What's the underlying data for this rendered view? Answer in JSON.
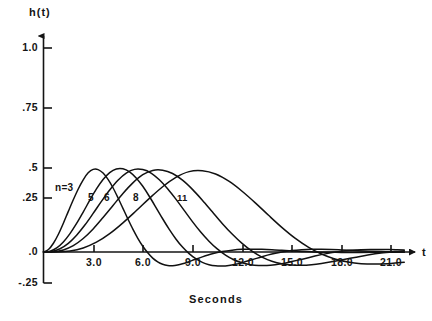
{
  "figure": {
    "axis_titles": {
      "y": "h(t)",
      "x": "t"
    },
    "x_axis_caption": "Seconds",
    "bottom_caption": ""
  },
  "chart_data": {
    "type": "line",
    "title": "",
    "subtitle": "",
    "xlabel": "Seconds",
    "ylabel": "h(t)",
    "xlim": [
      0,
      22.2
    ],
    "ylim": [
      -0.25,
      1.0
    ],
    "grid": false,
    "legend_position": "inline-curve-labels",
    "x_ticks": [
      3.0,
      6.0,
      9.0,
      12.0,
      15.0,
      18.0,
      21.0
    ],
    "x_tick_labels": [
      "3.0",
      "6.0",
      "9.0",
      "12.0",
      "15.0",
      "18.0",
      "21.0"
    ],
    "y_ticks": [
      1.0,
      0.75,
      0.5,
      0.25,
      0.0,
      -0.25
    ],
    "y_tick_labels": [
      "1.0",
      ".75",
      ".5",
      ".25",
      ".0",
      "-.25"
    ],
    "annotations": [
      {
        "text": "n=3",
        "x": 1.05,
        "y": 0.3
      },
      {
        "text": "5",
        "x": 2.75,
        "y": 0.255
      },
      {
        "text": "6",
        "x": 3.65,
        "y": 0.255
      },
      {
        "text": "8",
        "x": 5.35,
        "y": 0.255
      },
      {
        "text": "11",
        "x": 8.05,
        "y": 0.255
      }
    ],
    "series": [
      {
        "name": "n=3",
        "label": "n=3",
        "peak_time": 2.5,
        "peak_value": 0.405,
        "points": [
          [
            0.0,
            0.0
          ],
          [
            0.3,
            0.012
          ],
          [
            0.6,
            0.043
          ],
          [
            0.9,
            0.087
          ],
          [
            1.2,
            0.141
          ],
          [
            1.5,
            0.199
          ],
          [
            1.8,
            0.256
          ],
          [
            2.1,
            0.309
          ],
          [
            2.4,
            0.354
          ],
          [
            2.7,
            0.388
          ],
          [
            3.0,
            0.405
          ],
          [
            3.3,
            0.404
          ],
          [
            3.6,
            0.387
          ],
          [
            3.9,
            0.356
          ],
          [
            4.2,
            0.315
          ],
          [
            4.5,
            0.266
          ],
          [
            4.8,
            0.214
          ],
          [
            5.1,
            0.162
          ],
          [
            5.4,
            0.112
          ],
          [
            5.7,
            0.067
          ],
          [
            6.0,
            0.028
          ],
          [
            6.3,
            -0.004
          ],
          [
            6.6,
            -0.03
          ],
          [
            6.9,
            -0.048
          ],
          [
            7.2,
            -0.06
          ],
          [
            7.5,
            -0.066
          ],
          [
            7.8,
            -0.067
          ],
          [
            8.1,
            -0.064
          ],
          [
            8.4,
            -0.058
          ],
          [
            8.7,
            -0.05
          ],
          [
            9.0,
            -0.041
          ],
          [
            9.6,
            -0.024
          ],
          [
            10.2,
            -0.009
          ],
          [
            10.8,
            0.002
          ],
          [
            11.4,
            0.009
          ],
          [
            12.0,
            0.013
          ],
          [
            12.6,
            0.014
          ],
          [
            13.2,
            0.013
          ],
          [
            13.8,
            0.011
          ],
          [
            14.4,
            0.008
          ],
          [
            15.0,
            0.005
          ],
          [
            15.6,
            0.003
          ],
          [
            16.2,
            0.001
          ],
          [
            17.0,
            -0.001
          ],
          [
            18.0,
            -0.002
          ],
          [
            19.0,
            -0.002
          ],
          [
            20.0,
            -0.001
          ],
          [
            21.0,
            -0.001
          ],
          [
            21.8,
            0.0
          ]
        ]
      },
      {
        "name": "5",
        "label": "5",
        "peak_time": 3.7,
        "peak_value": 0.408,
        "points": [
          [
            0.0,
            0.0
          ],
          [
            0.4,
            0.004
          ],
          [
            0.8,
            0.02
          ],
          [
            1.2,
            0.049
          ],
          [
            1.6,
            0.09
          ],
          [
            2.0,
            0.14
          ],
          [
            2.4,
            0.196
          ],
          [
            2.8,
            0.254
          ],
          [
            3.2,
            0.309
          ],
          [
            3.6,
            0.355
          ],
          [
            4.0,
            0.389
          ],
          [
            4.4,
            0.407
          ],
          [
            4.8,
            0.408
          ],
          [
            5.2,
            0.393
          ],
          [
            5.6,
            0.363
          ],
          [
            6.0,
            0.322
          ],
          [
            6.4,
            0.272
          ],
          [
            6.8,
            0.218
          ],
          [
            7.2,
            0.163
          ],
          [
            7.6,
            0.111
          ],
          [
            8.0,
            0.064
          ],
          [
            8.4,
            0.024
          ],
          [
            8.8,
            -0.008
          ],
          [
            9.2,
            -0.033
          ],
          [
            9.6,
            -0.051
          ],
          [
            10.0,
            -0.062
          ],
          [
            10.4,
            -0.068
          ],
          [
            10.8,
            -0.069
          ],
          [
            11.2,
            -0.066
          ],
          [
            11.6,
            -0.06
          ],
          [
            12.0,
            -0.052
          ],
          [
            12.6,
            -0.038
          ],
          [
            13.2,
            -0.023
          ],
          [
            13.8,
            -0.01
          ],
          [
            14.4,
            0.0
          ],
          [
            15.0,
            0.007
          ],
          [
            15.6,
            0.011
          ],
          [
            16.2,
            0.013
          ],
          [
            16.8,
            0.013
          ],
          [
            17.4,
            0.012
          ],
          [
            18.0,
            0.01
          ],
          [
            18.8,
            0.007
          ],
          [
            19.6,
            0.004
          ],
          [
            20.4,
            0.002
          ],
          [
            21.2,
            0.0
          ],
          [
            21.8,
            -0.001
          ]
        ]
      },
      {
        "name": "6",
        "label": "6",
        "peak_time": 4.5,
        "peak_value": 0.404,
        "points": [
          [
            0.0,
            0.0
          ],
          [
            0.5,
            0.003
          ],
          [
            1.0,
            0.016
          ],
          [
            1.5,
            0.042
          ],
          [
            2.0,
            0.082
          ],
          [
            2.5,
            0.132
          ],
          [
            3.0,
            0.189
          ],
          [
            3.5,
            0.248
          ],
          [
            4.0,
            0.304
          ],
          [
            4.5,
            0.352
          ],
          [
            5.0,
            0.387
          ],
          [
            5.5,
            0.405
          ],
          [
            6.0,
            0.404
          ],
          [
            6.5,
            0.387
          ],
          [
            7.0,
            0.354
          ],
          [
            7.5,
            0.31
          ],
          [
            8.0,
            0.259
          ],
          [
            8.5,
            0.204
          ],
          [
            9.0,
            0.149
          ],
          [
            9.5,
            0.098
          ],
          [
            10.0,
            0.053
          ],
          [
            10.5,
            0.015
          ],
          [
            11.0,
            -0.015
          ],
          [
            11.5,
            -0.038
          ],
          [
            12.0,
            -0.053
          ],
          [
            12.5,
            -0.062
          ],
          [
            13.0,
            -0.066
          ],
          [
            13.5,
            -0.066
          ],
          [
            14.0,
            -0.062
          ],
          [
            14.5,
            -0.056
          ],
          [
            15.0,
            -0.047
          ],
          [
            15.7,
            -0.034
          ],
          [
            16.4,
            -0.02
          ],
          [
            17.1,
            -0.008
          ],
          [
            17.8,
            0.001
          ],
          [
            18.5,
            0.007
          ],
          [
            19.2,
            0.011
          ],
          [
            19.9,
            0.012
          ],
          [
            20.6,
            0.012
          ],
          [
            21.3,
            0.011
          ],
          [
            21.8,
            0.01
          ]
        ]
      },
      {
        "name": "8",
        "label": "8",
        "peak_time": 5.6,
        "peak_value": 0.4,
        "points": [
          [
            0.0,
            0.0
          ],
          [
            0.6,
            0.001
          ],
          [
            1.2,
            0.01
          ],
          [
            1.8,
            0.031
          ],
          [
            2.4,
            0.066
          ],
          [
            3.0,
            0.113
          ],
          [
            3.6,
            0.169
          ],
          [
            4.2,
            0.228
          ],
          [
            4.8,
            0.287
          ],
          [
            5.4,
            0.339
          ],
          [
            6.0,
            0.379
          ],
          [
            6.6,
            0.4
          ],
          [
            7.2,
            0.401
          ],
          [
            7.8,
            0.385
          ],
          [
            8.4,
            0.352
          ],
          [
            9.0,
            0.307
          ],
          [
            9.6,
            0.254
          ],
          [
            10.2,
            0.197
          ],
          [
            10.8,
            0.14
          ],
          [
            11.4,
            0.088
          ],
          [
            12.0,
            0.042
          ],
          [
            12.6,
            0.004
          ],
          [
            13.2,
            -0.025
          ],
          [
            13.8,
            -0.045
          ],
          [
            14.4,
            -0.058
          ],
          [
            15.0,
            -0.064
          ],
          [
            15.6,
            -0.065
          ],
          [
            16.2,
            -0.062
          ],
          [
            16.8,
            -0.056
          ],
          [
            17.4,
            -0.048
          ],
          [
            18.0,
            -0.039
          ],
          [
            18.8,
            -0.027
          ],
          [
            19.6,
            -0.015
          ],
          [
            20.4,
            -0.005
          ],
          [
            21.2,
            0.002
          ],
          [
            21.8,
            0.006
          ]
        ]
      },
      {
        "name": "11",
        "label": "11",
        "peak_time": 7.6,
        "peak_value": 0.398,
        "points": [
          [
            0.0,
            0.0
          ],
          [
            0.8,
            0.0
          ],
          [
            1.6,
            0.005
          ],
          [
            2.4,
            0.02
          ],
          [
            3.2,
            0.048
          ],
          [
            4.0,
            0.09
          ],
          [
            4.8,
            0.143
          ],
          [
            5.6,
            0.202
          ],
          [
            6.4,
            0.263
          ],
          [
            7.2,
            0.32
          ],
          [
            8.0,
            0.366
          ],
          [
            8.8,
            0.394
          ],
          [
            9.6,
            0.398
          ],
          [
            10.4,
            0.382
          ],
          [
            11.2,
            0.347
          ],
          [
            12.0,
            0.298
          ],
          [
            12.8,
            0.241
          ],
          [
            13.6,
            0.18
          ],
          [
            14.4,
            0.121
          ],
          [
            15.2,
            0.068
          ],
          [
            16.0,
            0.024
          ],
          [
            16.8,
            -0.01
          ],
          [
            17.6,
            -0.034
          ],
          [
            18.4,
            -0.049
          ],
          [
            19.2,
            -0.057
          ],
          [
            20.0,
            -0.059
          ],
          [
            20.8,
            -0.057
          ],
          [
            21.4,
            -0.053
          ],
          [
            21.8,
            -0.05
          ]
        ]
      }
    ]
  }
}
